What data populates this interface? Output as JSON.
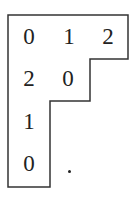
{
  "diagram": {
    "type": "young-tableau",
    "rows": [
      [
        "0",
        "1",
        "2"
      ],
      [
        "2",
        "0"
      ],
      [
        "1"
      ],
      [
        "0"
      ]
    ],
    "trailing_mark": ".",
    "line_color": "#333333",
    "text_color": "#222222"
  }
}
